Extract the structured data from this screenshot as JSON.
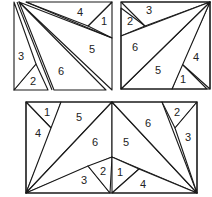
{
  "diagram": {
    "colors": {
      "stroke": "#1a1a1a",
      "fill": "#ffffff",
      "text": "#222222"
    },
    "figures": [
      {
        "id": "top-left",
        "pieces": [
          {
            "label": "1",
            "points": "112,2 112,38 88,26",
            "lx": 104,
            "ly": 22
          },
          {
            "label": "2",
            "points": "14,90 48,90 36,64",
            "lx": 33,
            "ly": 82
          },
          {
            "label": "3",
            "points": "14,2 14,90 36,64",
            "lx": 21,
            "ly": 57
          },
          {
            "label": "4",
            "points": "26,2 112,2 88,26",
            "lx": 80,
            "ly": 13
          },
          {
            "label": "5",
            "points": "19,2 112,90 112,38",
            "lx": 92,
            "ly": 50
          },
          {
            "label": "6",
            "points": "19,2 54,90 106,90",
            "lx": 61,
            "ly": 72
          }
        ],
        "extra_lines": [
          "17,2 52,90",
          "26,2 112,38"
        ]
      },
      {
        "id": "top-right",
        "frame": "121,2 210,2 210,89 121,89",
        "pieces": [
          {
            "label": "1",
            "points": "172,89 182,64 207,89",
            "lx": 183,
            "ly": 80
          },
          {
            "label": "2",
            "points": "121,8 121,36 145,26",
            "lx": 130,
            "ly": 22
          },
          {
            "label": "3",
            "points": "121,2 210,2 145,26",
            "lx": 149,
            "ly": 11
          },
          {
            "label": "4",
            "points": "210,2 210,89 182,64",
            "lx": 196,
            "ly": 58
          },
          {
            "label": "5",
            "points": "121,89 210,2 172,89",
            "lx": 158,
            "ly": 71
          },
          {
            "label": "6",
            "points": "121,36 121,89 210,2",
            "lx": 135,
            "ly": 48
          }
        ]
      },
      {
        "id": "bottom",
        "frame": "26,102 197,102 197,193 26,193",
        "pieces": [
          {
            "label": "1",
            "points": "26,102 61,102 52,129",
            "lx": 47,
            "ly": 113
          },
          {
            "label": "4",
            "points": "26,102 52,129 26,193",
            "lx": 38,
            "ly": 134
          },
          {
            "label": "5",
            "points": "61,102 112,102 26,193",
            "lx": 79,
            "ly": 118
          },
          {
            "label": "6",
            "points": "112,102 112,157 26,193",
            "lx": 95,
            "ly": 143
          },
          {
            "label": "3",
            "points": "26,193 88,166 110,193",
            "lx": 84,
            "ly": 181
          },
          {
            "label": "2",
            "points": "88,166 112,157 110,193",
            "lx": 103,
            "ly": 172
          },
          {
            "label": "5",
            "points": "112,102 112,157 197,193",
            "lx": 126,
            "ly": 143
          },
          {
            "label": "6",
            "points": "112,102 162,102 197,193",
            "lx": 148,
            "ly": 124
          },
          {
            "label": "2",
            "points": "162,102 197,102 175,128",
            "lx": 177,
            "ly": 113
          },
          {
            "label": "3",
            "points": "175,128 197,102 197,193",
            "lx": 188,
            "ly": 138
          },
          {
            "label": "1",
            "points": "112,157 139,169 112,193",
            "lx": 120,
            "ly": 173
          },
          {
            "label": "4",
            "points": "112,193 139,169 197,193",
            "lx": 143,
            "ly": 185
          }
        ]
      }
    ]
  }
}
